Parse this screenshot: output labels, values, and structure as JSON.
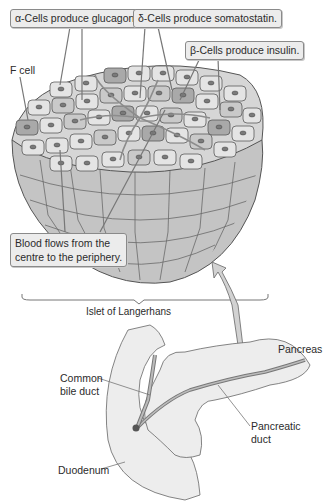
{
  "diagram": {
    "title": "Islet of Langerhans",
    "callouts": {
      "alpha": "α-Cells produce glucagon.",
      "delta": "δ-Cells produce somatostatin.",
      "beta": "β-Cells produce insulin.",
      "blood_line1": "Blood flows from the",
      "blood_line2": "centre to the periphery."
    },
    "labels": {
      "f_cell": "F cell",
      "islet": "Islet of Langerhans",
      "pancreas": "Pancreas",
      "common_bile_duct_line1": "Common",
      "common_bile_duct_line2": "bile duct",
      "pancreatic_duct_line1": "Pancreatic",
      "pancreatic_duct_line2": "duct",
      "duodenum": "Duodenum"
    },
    "colors": {
      "callout_bg": "#ececec",
      "cell_light": "#e4e4e4",
      "cell_mid": "#c9c9c9",
      "cell_dark": "#a9a9a9",
      "organ_fill": "#ededed",
      "outline": "#555555"
    }
  }
}
